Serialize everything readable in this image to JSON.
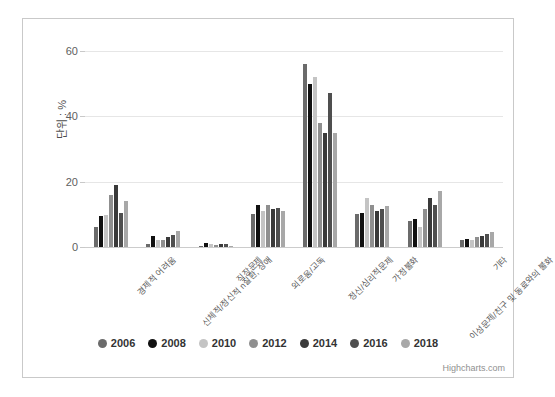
{
  "chart_data": {
    "type": "bar",
    "title": "",
    "subtitle": "",
    "xlabel": "",
    "ylabel": "단위 : %",
    "ylim": [
      0,
      60
    ],
    "yticks": [
      0,
      20,
      40,
      60
    ],
    "grid": true,
    "legend_position": "bottom",
    "credits": "Highcharts.com",
    "categories": [
      "경제적 어려움",
      "신체적/정신적 n질환, 장애",
      "직장문제",
      "외로움/고독",
      "가정불화",
      "이성문제/친구 및 동료와의 불화",
      "기타"
    ],
    "series": [
      {
        "name": "2006",
        "color": "#6b6b6b",
        "values": [
          6.0,
          1.0,
          0.3,
          10.0,
          10.0,
          8.0,
          2.0
        ]
      },
      {
        "name": "2008",
        "color": "#111111",
        "values": [
          9.5,
          3.4,
          1.2,
          13.0,
          10.5,
          8.5,
          2.5
        ]
      },
      {
        "name": "2010",
        "color": "#c4c4c4",
        "values": [
          9.8,
          2.0,
          1.0,
          11.0,
          15.0,
          6.0,
          2.0
        ]
      },
      {
        "name": "2012",
        "color": "#8f8f8f",
        "values": [
          16.0,
          2.2,
          0.5,
          13.0,
          13.0,
          11.5,
          3.0
        ]
      },
      {
        "name": "2014",
        "color": "#3a3a3a",
        "values": [
          19.0,
          3.0,
          1.0,
          11.5,
          11.0,
          15.0,
          3.5
        ]
      },
      {
        "name": "2016",
        "color": "#4f4f4f",
        "values": [
          10.5,
          3.8,
          0.8,
          12.0,
          11.5,
          13.0,
          4.0
        ]
      },
      {
        "name": "2018",
        "color": "#a8a8a8",
        "values": [
          14.0,
          5.0,
          0.4,
          11.0,
          12.5,
          17.0,
          4.5
        ]
      }
    ],
    "tall_group_index": 4,
    "tall_group_label": "정신/심리적문제",
    "tall_group_values": [
      56.0,
      50.0,
      52.0,
      38.0,
      35.0,
      47.0,
      35.0
    ]
  },
  "legend": {
    "items": [
      {
        "label": "2006",
        "color": "#6b6b6b"
      },
      {
        "label": "2008",
        "color": "#111111"
      },
      {
        "label": "2010",
        "color": "#c4c4c4"
      },
      {
        "label": "2012",
        "color": "#8f8f8f"
      },
      {
        "label": "2014",
        "color": "#3a3a3a"
      },
      {
        "label": "2016",
        "color": "#4f4f4f"
      },
      {
        "label": "2018",
        "color": "#a8a8a8"
      }
    ]
  },
  "axis": {
    "y_title": "단위 : %",
    "y_ticks": [
      "0",
      "20",
      "40",
      "60"
    ]
  },
  "credits": {
    "text": "Highcharts.com"
  }
}
